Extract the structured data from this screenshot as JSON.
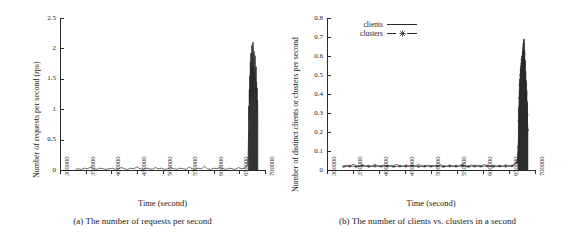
{
  "figure": {
    "panels": [
      {
        "id": "panel-a",
        "caption": "(a) The number of requests per second",
        "ylabel": "Number of requests per second (rps)",
        "xlabel": "Time (second)"
      },
      {
        "id": "panel-b",
        "caption": "(b) The number of clients vs. clusters in a second",
        "ylabel": "Number of distinct clients or clusters per second",
        "xlabel": "Time (second)"
      }
    ],
    "legend": {
      "items": [
        {
          "label": "clients",
          "style": "solid-line",
          "marker": "none"
        },
        {
          "label": "clusters",
          "style": "line-with-markers",
          "marker": "star-icon"
        }
      ]
    },
    "colors": {
      "ink": "#2b2b2b",
      "background": "#ffffff"
    }
  },
  "chart_data": [
    {
      "type": "line",
      "id": "requests-per-second",
      "title": "(a) The number of requests per second",
      "xlabel": "Time (second)",
      "ylabel": "Number of requests per second (rps)",
      "xlim": [
        300000,
        700000
      ],
      "ylim": [
        0,
        2.5
      ],
      "xticks": [
        300000,
        350000,
        400000,
        450000,
        500000,
        550000,
        600000,
        650000,
        700000
      ],
      "xticklabels": [
        "300000",
        "350000",
        "400000",
        "450000",
        "500000",
        "550000",
        "600000",
        "650000",
        "700000"
      ],
      "yticks": [
        0,
        0.5,
        1,
        1.5,
        2,
        2.5
      ],
      "yticklabels": [
        "0",
        "0.5",
        "1",
        "1.5",
        "2",
        "2.5"
      ],
      "grid": false,
      "legend_position": "none",
      "xtick_label_rotation": 90,
      "series": [
        {
          "name": "requests",
          "description": "Near-zero baseline from 330000 to 668000 with small sporadic bumps up to 0.09, then a dense high-frequency burst between 668000 and 686000 peaking at about 2.1",
          "x": [
            330000,
            336000,
            342000,
            348000,
            354000,
            360000,
            366000,
            372000,
            378000,
            384000,
            390000,
            396000,
            402000,
            408000,
            414000,
            420000,
            426000,
            432000,
            438000,
            444000,
            450000,
            456000,
            462000,
            468000,
            474000,
            480000,
            486000,
            492000,
            498000,
            504000,
            510000,
            516000,
            522000,
            528000,
            534000,
            540000,
            546000,
            552000,
            558000,
            564000,
            570000,
            576000,
            582000,
            588000,
            594000,
            600000,
            606000,
            612000,
            618000,
            624000,
            630000,
            636000,
            642000,
            648000,
            654000,
            660000,
            664000,
            666000,
            667000,
            668000,
            668500,
            669000,
            669500,
            670000,
            670500,
            671000,
            671500,
            672000,
            672500,
            673000,
            673500,
            674000,
            674500,
            675000,
            675500,
            676000,
            676500,
            677000,
            677500,
            678000,
            678500,
            679000,
            679500,
            680000,
            680500,
            681000,
            681500,
            682000,
            682500,
            683000,
            683500,
            684000,
            684500,
            685000,
            685500,
            686000
          ],
          "y": [
            0.01,
            0.02,
            0.01,
            0.03,
            0.02,
            0.05,
            0.02,
            0.01,
            0.03,
            0.02,
            0.01,
            0.02,
            0.03,
            0.01,
            0.02,
            0.04,
            0.02,
            0.01,
            0.03,
            0.02,
            0.05,
            0.02,
            0.01,
            0.03,
            0.02,
            0.01,
            0.04,
            0.02,
            0.03,
            0.01,
            0.02,
            0.04,
            0.02,
            0.01,
            0.03,
            0.02,
            0.01,
            0.05,
            0.02,
            0.01,
            0.03,
            0.02,
            0.06,
            0.02,
            0.01,
            0.03,
            0.02,
            0.04,
            0.02,
            0.01,
            0.03,
            0.02,
            0.01,
            0.04,
            0.02,
            0.03,
            0.05,
            0.09,
            0.22,
            0.62,
            1.05,
            0.78,
            1.32,
            0.95,
            1.55,
            1.12,
            1.78,
            1.2,
            1.92,
            1.05,
            1.68,
            1.3,
            2.05,
            1.15,
            1.85,
            1.28,
            2.1,
            1.35,
            1.72,
            1.18,
            1.95,
            1.08,
            1.62,
            1.25,
            1.88,
            1.1,
            1.52,
            1.3,
            1.7,
            1.05,
            1.45,
            1.22,
            1.35,
            0.98,
            1.15,
            0.7
          ]
        }
      ]
    },
    {
      "type": "line",
      "id": "clients-vs-clusters",
      "title": "(b) The number of clients vs. clusters in a second",
      "xlabel": "Time (second)",
      "ylabel": "Number of distinct clients or clusters per second",
      "xlim": [
        300000,
        700000
      ],
      "ylim": [
        0,
        0.8
      ],
      "xticks": [
        300000,
        350000,
        400000,
        450000,
        500000,
        550000,
        600000,
        650000,
        700000
      ],
      "xticklabels": [
        "300000",
        "350000",
        "400000",
        "450000",
        "500000",
        "550000",
        "600000",
        "650000",
        "700000"
      ],
      "yticks": [
        0,
        0.1,
        0.2,
        0.3,
        0.4,
        0.5,
        0.6,
        0.7,
        0.8
      ],
      "yticklabels": [
        "0",
        "0.1",
        "0.2",
        "0.3",
        "0.4",
        "0.5",
        "0.6",
        "0.7",
        "0.8"
      ],
      "grid": false,
      "legend_position": "top-left",
      "xtick_label_rotation": 90,
      "series": [
        {
          "name": "clients",
          "description": "Dense baseline band near 0.02 from 332000 to 668000, then a tall dense burst between 668000 and 686000 peaking at about 0.69",
          "x": [
            332000,
            338000,
            344000,
            350000,
            356000,
            362000,
            368000,
            374000,
            380000,
            386000,
            392000,
            398000,
            404000,
            410000,
            416000,
            422000,
            428000,
            434000,
            440000,
            446000,
            452000,
            458000,
            464000,
            470000,
            476000,
            482000,
            488000,
            494000,
            500000,
            506000,
            512000,
            518000,
            524000,
            530000,
            536000,
            542000,
            548000,
            554000,
            560000,
            566000,
            572000,
            578000,
            584000,
            590000,
            596000,
            602000,
            608000,
            614000,
            620000,
            626000,
            632000,
            638000,
            644000,
            650000,
            656000,
            662000,
            666000,
            667500,
            668500,
            669000,
            669500,
            670000,
            670500,
            671000,
            671500,
            672000,
            672500,
            673000,
            673500,
            674000,
            674500,
            675000,
            675500,
            676000,
            676500,
            677000,
            677500,
            678000,
            678500,
            679000,
            679500,
            680000,
            680500,
            681000,
            681500,
            682000,
            682500,
            683000,
            683500,
            684000,
            684500,
            685000,
            685500,
            686000
          ],
          "y": [
            0.02,
            0.025,
            0.02,
            0.03,
            0.022,
            0.02,
            0.028,
            0.02,
            0.025,
            0.02,
            0.03,
            0.022,
            0.02,
            0.026,
            0.02,
            0.024,
            0.02,
            0.03,
            0.022,
            0.02,
            0.027,
            0.02,
            0.025,
            0.02,
            0.03,
            0.022,
            0.02,
            0.026,
            0.02,
            0.024,
            0.02,
            0.029,
            0.022,
            0.02,
            0.026,
            0.02,
            0.024,
            0.02,
            0.03,
            0.022,
            0.02,
            0.027,
            0.02,
            0.025,
            0.02,
            0.03,
            0.022,
            0.02,
            0.026,
            0.02,
            0.024,
            0.02,
            0.028,
            0.022,
            0.02,
            0.03,
            0.05,
            0.1,
            0.2,
            0.33,
            0.27,
            0.42,
            0.31,
            0.48,
            0.35,
            0.52,
            0.38,
            0.55,
            0.4,
            0.58,
            0.43,
            0.6,
            0.45,
            0.62,
            0.47,
            0.65,
            0.44,
            0.68,
            0.46,
            0.69,
            0.42,
            0.63,
            0.4,
            0.58,
            0.38,
            0.52,
            0.36,
            0.47,
            0.33,
            0.42,
            0.3,
            0.36,
            0.27,
            0.22
          ]
        },
        {
          "name": "clusters",
          "description": "Tracks slightly below the clients curve over the same range; baseline near 0.018 and burst peak about 0.66",
          "x": [
            332000,
            344000,
            356000,
            368000,
            380000,
            392000,
            404000,
            416000,
            428000,
            440000,
            452000,
            464000,
            476000,
            488000,
            500000,
            512000,
            524000,
            536000,
            548000,
            560000,
            572000,
            584000,
            596000,
            608000,
            620000,
            632000,
            644000,
            656000,
            666000,
            668000,
            669000,
            670000,
            671000,
            672000,
            673000,
            674000,
            675000,
            676000,
            677000,
            678000,
            679000,
            680000,
            681000,
            682000,
            683000,
            684000,
            685000,
            686000
          ],
          "y": [
            0.018,
            0.02,
            0.018,
            0.022,
            0.018,
            0.02,
            0.019,
            0.021,
            0.018,
            0.02,
            0.019,
            0.022,
            0.018,
            0.02,
            0.019,
            0.021,
            0.018,
            0.02,
            0.019,
            0.022,
            0.018,
            0.02,
            0.019,
            0.021,
            0.018,
            0.02,
            0.019,
            0.022,
            0.04,
            0.12,
            0.26,
            0.38,
            0.45,
            0.5,
            0.53,
            0.56,
            0.58,
            0.6,
            0.62,
            0.66,
            0.61,
            0.56,
            0.5,
            0.45,
            0.4,
            0.34,
            0.29,
            0.21
          ]
        }
      ]
    }
  ]
}
